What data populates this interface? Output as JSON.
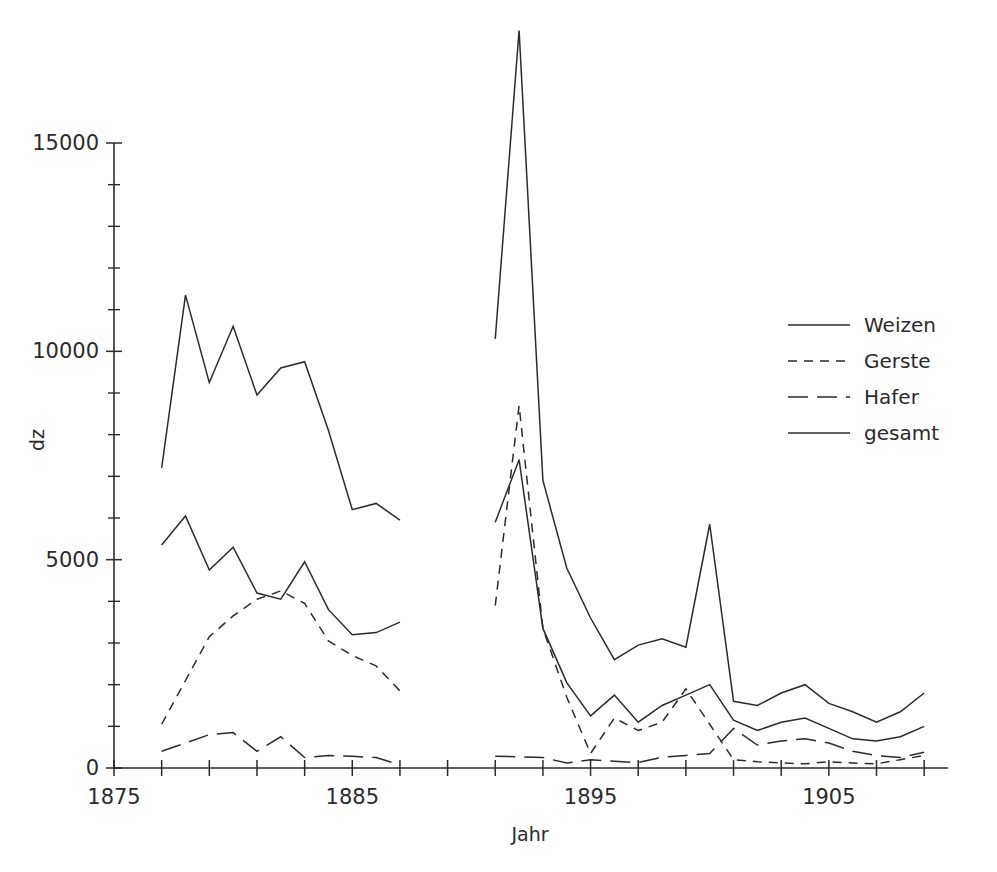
{
  "chart_data": {
    "type": "line",
    "title": "",
    "xlabel": "Jahr",
    "ylabel": "dz",
    "xlim": [
      1875,
      1910
    ],
    "ylim": [
      0,
      15700
    ],
    "grid": false,
    "legend_position": "right",
    "x_ticks_labeled": [
      1875,
      1885,
      1895,
      1905
    ],
    "x_tick_step": 2,
    "y_ticks_labeled": [
      0,
      5000,
      10000,
      15000
    ],
    "y_tick_minor_step": 1000,
    "note": "Two disjoint data blocks: 1877-1887 and 1891-1909. Values in dz.",
    "series": [
      {
        "name": "Weizen",
        "style": "solid",
        "blocks": [
          {
            "x": [
              1877,
              1878,
              1879,
              1880,
              1881,
              1882,
              1883,
              1884,
              1885,
              1886,
              1887
            ],
            "y": [
              5350,
              6050,
              4750,
              5300,
              4200,
              4050,
              4950,
              3800,
              3200,
              3250,
              3500
            ]
          },
          {
            "x": [
              1891,
              1892,
              1893,
              1894,
              1895,
              1896,
              1897,
              1898,
              1899,
              1900,
              1901,
              1902,
              1903,
              1904,
              1905,
              1906,
              1907,
              1908,
              1909
            ],
            "y": [
              5900,
              7400,
              3350,
              2050,
              1250,
              1750,
              1100,
              1500,
              1750,
              2000,
              1150,
              900,
              1100,
              1200,
              950,
              700,
              650,
              750,
              1000
            ]
          }
        ]
      },
      {
        "name": "Gerste",
        "style": "dashed",
        "blocks": [
          {
            "x": [
              1877,
              1878,
              1879,
              1880,
              1881,
              1882,
              1883,
              1884,
              1885,
              1886,
              1887
            ],
            "y": [
              1050,
              2100,
              3150,
              3650,
              4050,
              4250,
              3950,
              3050,
              2700,
              2450,
              1850
            ]
          },
          {
            "x": [
              1891,
              1892,
              1893,
              1894,
              1895,
              1896,
              1897,
              1898,
              1899,
              1900,
              1901,
              1902,
              1903,
              1904,
              1905,
              1906,
              1907,
              1908,
              1909
            ],
            "y": [
              3900,
              8700,
              3350,
              1700,
              350,
              1200,
              900,
              1100,
              1900,
              1050,
              200,
              150,
              120,
              100,
              150,
              120,
              100,
              200,
              300
            ]
          }
        ]
      },
      {
        "name": "Hafer",
        "style": "dash-long",
        "blocks": [
          {
            "x": [
              1877,
              1878,
              1879,
              1880,
              1881,
              1882,
              1883,
              1884,
              1885,
              1886,
              1887
            ],
            "y": [
              400,
              600,
              800,
              850,
              400,
              750,
              250,
              300,
              280,
              250,
              80
            ]
          },
          {
            "x": [
              1891,
              1892,
              1893,
              1894,
              1895,
              1896,
              1897,
              1898,
              1899,
              1900,
              1901,
              1902,
              1903,
              1904,
              1905,
              1906,
              1907,
              1908,
              1909
            ],
            "y": [
              280,
              270,
              250,
              120,
              200,
              160,
              130,
              260,
              300,
              350,
              950,
              550,
              650,
              700,
              600,
              400,
              300,
              250,
              380
            ]
          }
        ]
      },
      {
        "name": "gesamt",
        "style": "solid",
        "blocks": [
          {
            "x": [
              1877,
              1878,
              1879,
              1880,
              1881,
              1882,
              1883,
              1884,
              1885,
              1886,
              1887
            ],
            "y": [
              7200,
              11350,
              9250,
              10600,
              8950,
              9600,
              9750,
              8100,
              6200,
              6350,
              5950
            ]
          },
          {
            "x": [
              1891,
              1892,
              1893,
              1894,
              1895,
              1896,
              1897,
              1898,
              1899,
              1900,
              1901,
              1902,
              1903,
              1904,
              1905,
              1906,
              1907,
              1908,
              1909
            ],
            "y": [
              10300,
              17700,
              6900,
              4800,
              3600,
              2600,
              2950,
              3100,
              2900,
              5850,
              1600,
              1500,
              1800,
              2000,
              1550,
              1350,
              1100,
              1350,
              1800
            ]
          }
        ]
      }
    ]
  },
  "legend": {
    "items": [
      {
        "label": "Weizen",
        "style": "solid"
      },
      {
        "label": "Gerste",
        "style": "dashed"
      },
      {
        "label": "Hafer",
        "style": "dash-long"
      },
      {
        "label": "gesamt",
        "style": "solid"
      }
    ]
  },
  "axes": {
    "y_title": "dz",
    "x_title": "Jahr",
    "y_labels": [
      "0",
      "5000",
      "10000",
      "15000"
    ],
    "x_labels": [
      "1875",
      "1885",
      "1895",
      "1905"
    ]
  }
}
